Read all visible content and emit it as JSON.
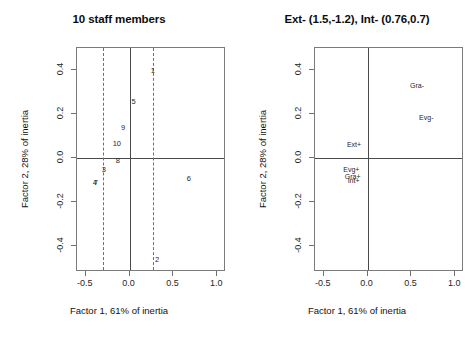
{
  "figure": {
    "caption": "Correspondence analysis biplots of 10 staff members and attribute categories"
  },
  "chart_data": [
    {
      "type": "scatter",
      "panel": "left",
      "title": "10 staff members",
      "xlabel": "Factor 1, 61% of inertia",
      "ylabel": "Factor 2, 28% of inertia",
      "xlim": [
        -0.6,
        1.1
      ],
      "ylim": [
        -0.52,
        0.5
      ],
      "xticks": [
        -0.5,
        0.0,
        0.5,
        1.0
      ],
      "xticklabels": [
        "-0.5",
        "0.0",
        "0.5",
        "1.0"
      ],
      "yticks": [
        -0.4,
        -0.2,
        0.0,
        0.2,
        0.4
      ],
      "yticklabels": [
        "-0.4",
        "-0.2",
        "0.0",
        "0.2",
        "0.4"
      ],
      "grid": false,
      "legend": null,
      "reference_lines": {
        "horizontal_solid": [
          0.0
        ],
        "vertical_solid": [
          0.0
        ],
        "vertical_dashed": [
          -0.3,
          0.27
        ]
      },
      "points": [
        {
          "label": "1",
          "x": 0.265,
          "y": 0.395
        },
        {
          "label": "5",
          "x": 0.045,
          "y": 0.255
        },
        {
          "label": "9",
          "x": -0.075,
          "y": 0.135
        },
        {
          "label": "10",
          "x": -0.145,
          "y": 0.065
        },
        {
          "label": "8",
          "x": -0.135,
          "y": -0.015
        },
        {
          "label": "3",
          "x": -0.295,
          "y": -0.055
        },
        {
          "label": "4",
          "x": -0.395,
          "y": -0.115
        },
        {
          "label": "7",
          "x": -0.385,
          "y": -0.115
        },
        {
          "label": "6",
          "x": 0.675,
          "y": -0.095
        },
        {
          "label": "2",
          "x": 0.315,
          "y": -0.465
        }
      ]
    },
    {
      "type": "scatter",
      "panel": "right",
      "title": "Ext- (1.5,-1.2), Int- (0.76,0.7)",
      "xlabel": "Factor 1, 61% of inertia",
      "ylabel": "Factor 2, 28% of inertia",
      "xlim": [
        -0.6,
        1.1
      ],
      "ylim": [
        -0.52,
        0.5
      ],
      "xticks": [
        -0.5,
        0.0,
        0.5,
        1.0
      ],
      "xticklabels": [
        "-0.5",
        "0.0",
        "0.5",
        "1.0"
      ],
      "yticks": [
        -0.4,
        -0.2,
        0.0,
        0.2,
        0.4
      ],
      "yticklabels": [
        "-0.4",
        "-0.2",
        "0.0",
        "0.2",
        "0.4"
      ],
      "grid": false,
      "legend": null,
      "reference_lines": {
        "horizontal_solid": [
          0.0
        ],
        "vertical_solid": [
          0.0
        ],
        "vertical_dashed": []
      },
      "points": [
        {
          "label": "Gra-",
          "x": 0.565,
          "y": 0.33
        },
        {
          "label": "Evg-",
          "x": 0.67,
          "y": 0.185
        },
        {
          "label": "Ext+",
          "x": -0.155,
          "y": 0.065
        },
        {
          "label": "Evg+",
          "x": -0.185,
          "y": -0.05
        },
        {
          "label": "Gra+",
          "x": -0.17,
          "y": -0.085
        },
        {
          "label": "Int+",
          "x": -0.16,
          "y": -0.1
        }
      ]
    }
  ]
}
